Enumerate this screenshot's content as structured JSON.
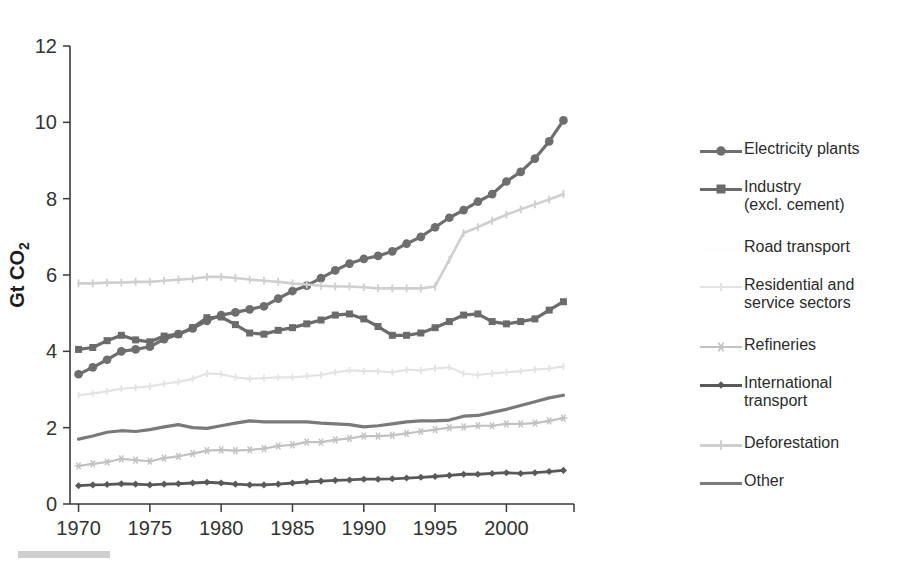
{
  "chart_data": {
    "type": "line",
    "title": "",
    "xlabel": "",
    "ylabel": "Gt CO2",
    "ylabel_main": "Gt CO",
    "ylabel_subscript": "2",
    "xlim": [
      1969.4,
      2004.6
    ],
    "ylim": [
      0,
      12
    ],
    "yticks": [
      0,
      2,
      4,
      6,
      8,
      10,
      12
    ],
    "ytick_labels": [
      "0",
      "2",
      "4",
      "6",
      "8",
      "10",
      "12"
    ],
    "xticks": [
      1970,
      1975,
      1980,
      1985,
      1990,
      1995,
      2000
    ],
    "xtick_labels": [
      "1970",
      "1975",
      "1980",
      "1985",
      "1990",
      "1995",
      "2000"
    ],
    "grid": false,
    "legend_position": "right",
    "x": [
      1970,
      1971,
      1972,
      1973,
      1974,
      1975,
      1976,
      1977,
      1978,
      1979,
      1980,
      1981,
      1982,
      1983,
      1984,
      1985,
      1986,
      1987,
      1988,
      1989,
      1990,
      1991,
      1992,
      1993,
      1994,
      1995,
      1996,
      1997,
      1998,
      1999,
      2000,
      2001,
      2002,
      2003,
      2004
    ],
    "series": [
      {
        "name": "Electricity plants",
        "color": "#6e6e6e",
        "marker": "circle",
        "line_width": 3.2,
        "marker_size": 7.5,
        "values": [
          3.4,
          3.58,
          3.78,
          4.0,
          4.05,
          4.12,
          4.32,
          4.45,
          4.6,
          4.8,
          4.95,
          5.02,
          5.1,
          5.18,
          5.38,
          5.58,
          5.72,
          5.92,
          6.12,
          6.3,
          6.42,
          6.5,
          6.62,
          6.82,
          7.0,
          7.25,
          7.5,
          7.7,
          7.92,
          8.12,
          8.45,
          8.7,
          9.05,
          9.5,
          10.05
        ]
      },
      {
        "name": "Industry (excl. cement)",
        "color": "#6b6b6b",
        "marker": "square",
        "line_width": 3.2,
        "marker_size": 7.0,
        "values": [
          4.05,
          4.1,
          4.28,
          4.42,
          4.3,
          4.25,
          4.4,
          4.45,
          4.62,
          4.88,
          4.9,
          4.7,
          4.48,
          4.45,
          4.55,
          4.62,
          4.72,
          4.82,
          4.95,
          4.98,
          4.85,
          4.65,
          4.42,
          4.42,
          4.48,
          4.62,
          4.78,
          4.95,
          4.98,
          4.78,
          4.72,
          4.78,
          4.85,
          5.08,
          5.3
        ]
      },
      {
        "name": "Road transport",
        "color": "#fdfdfd",
        "marker": "plus",
        "line_width": 2.0,
        "marker_size": 4.5,
        "values": [
          null,
          null,
          null,
          null,
          null,
          null,
          null,
          null,
          null,
          null,
          null,
          null,
          null,
          null,
          null,
          null,
          null,
          null,
          null,
          null,
          null,
          null,
          null,
          null,
          null,
          null,
          null,
          null,
          null,
          null,
          null,
          null,
          null,
          null,
          null
        ]
      },
      {
        "name": "Residential and service sectors",
        "color": "#e3e3e3",
        "marker": "plus",
        "line_width": 2.2,
        "marker_size": 4.5,
        "values": [
          2.85,
          2.9,
          2.95,
          3.02,
          3.05,
          3.08,
          3.15,
          3.2,
          3.28,
          3.42,
          3.4,
          3.32,
          3.28,
          3.3,
          3.32,
          3.32,
          3.35,
          3.38,
          3.45,
          3.5,
          3.48,
          3.48,
          3.45,
          3.52,
          3.5,
          3.55,
          3.58,
          3.42,
          3.38,
          3.42,
          3.45,
          3.48,
          3.52,
          3.55,
          3.6
        ]
      },
      {
        "name": "Refineries",
        "color": "#c2c2c2",
        "marker": "star",
        "line_width": 2.2,
        "marker_size": 6.0,
        "values": [
          1.0,
          1.05,
          1.1,
          1.18,
          1.15,
          1.12,
          1.2,
          1.25,
          1.32,
          1.4,
          1.42,
          1.4,
          1.42,
          1.45,
          1.52,
          1.55,
          1.62,
          1.62,
          1.68,
          1.72,
          1.78,
          1.78,
          1.8,
          1.85,
          1.9,
          1.95,
          2.0,
          2.02,
          2.05,
          2.05,
          2.1,
          2.1,
          2.12,
          2.18,
          2.25
        ]
      },
      {
        "name": "International transport",
        "color": "#595959",
        "marker": "diamond",
        "line_width": 2.8,
        "marker_size": 5.5,
        "values": [
          0.48,
          0.5,
          0.51,
          0.53,
          0.52,
          0.5,
          0.52,
          0.53,
          0.55,
          0.57,
          0.55,
          0.52,
          0.5,
          0.5,
          0.52,
          0.55,
          0.58,
          0.6,
          0.62,
          0.63,
          0.65,
          0.65,
          0.66,
          0.68,
          0.7,
          0.72,
          0.75,
          0.78,
          0.78,
          0.8,
          0.82,
          0.8,
          0.82,
          0.85,
          0.88
        ]
      },
      {
        "name": "Deforestation",
        "color": "#cfcfcf",
        "marker": "plus",
        "line_width": 2.6,
        "marker_size": 5.5,
        "values": [
          5.78,
          5.78,
          5.8,
          5.8,
          5.82,
          5.82,
          5.85,
          5.88,
          5.9,
          5.95,
          5.95,
          5.92,
          5.88,
          5.85,
          5.82,
          5.78,
          5.75,
          5.72,
          5.7,
          5.7,
          5.68,
          5.65,
          5.65,
          5.65,
          5.65,
          5.7,
          6.4,
          7.1,
          7.25,
          7.42,
          7.58,
          7.72,
          7.85,
          7.98,
          8.12
        ]
      },
      {
        "name": "Other",
        "color": "#7a7a7a",
        "marker": "none",
        "line_width": 3.2,
        "marker_size": 0,
        "values": [
          1.7,
          1.78,
          1.88,
          1.92,
          1.9,
          1.95,
          2.02,
          2.08,
          2.0,
          1.98,
          2.05,
          2.12,
          2.18,
          2.15,
          2.15,
          2.15,
          2.15,
          2.12,
          2.1,
          2.08,
          2.02,
          2.05,
          2.1,
          2.15,
          2.18,
          2.18,
          2.2,
          2.3,
          2.32,
          2.4,
          2.48,
          2.58,
          2.68,
          2.78,
          2.85
        ]
      }
    ]
  },
  "legend": {
    "entries": [
      {
        "label": "Electricity plants",
        "label2": ""
      },
      {
        "label": "Industry",
        "label2": "(excl. cement)"
      },
      {
        "label": "Road transport",
        "label2": ""
      },
      {
        "label": "Residential and",
        "label2": "service sectors"
      },
      {
        "label": "Refineries",
        "label2": ""
      },
      {
        "label": "International",
        "label2": "transport"
      },
      {
        "label": "Deforestation",
        "label2": ""
      },
      {
        "label": "Other",
        "label2": ""
      }
    ]
  }
}
